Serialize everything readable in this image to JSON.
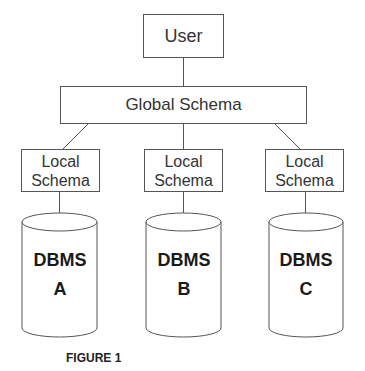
{
  "diagram": {
    "user": {
      "label": "User"
    },
    "global_schema": {
      "label": "Global Schema"
    },
    "local_schemas": [
      {
        "line1": "Local",
        "line2": "Schema"
      },
      {
        "line1": "Local",
        "line2": "Schema"
      },
      {
        "line1": "Local",
        "line2": "Schema"
      }
    ],
    "databases": [
      {
        "line1": "DBMS",
        "line2": "A"
      },
      {
        "line1": "DBMS",
        "line2": "B"
      },
      {
        "line1": "DBMS",
        "line2": "C"
      }
    ],
    "caption": "FIGURE 1",
    "colors": {
      "stroke": "#555555",
      "text": "#222222",
      "background": "#ffffff"
    }
  }
}
